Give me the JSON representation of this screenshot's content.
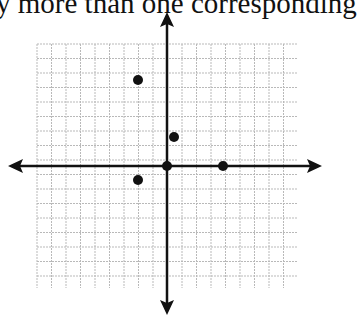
{
  "caption": "y more than one corresponding",
  "graph": {
    "grid": {
      "left": 37,
      "top": 44,
      "right": 297,
      "bottom": 288,
      "cell": 14.5
    },
    "origin": {
      "x": 167,
      "y": 166
    },
    "axes": {
      "x": {
        "start": 8,
        "end": 322
      },
      "y": {
        "start": 12,
        "end": 315
      }
    },
    "points": [
      {
        "label": "(-2, 6)",
        "px": 138,
        "py": 80
      },
      {
        "label": "(0.5, 2)",
        "px": 174,
        "py": 137
      },
      {
        "label": "(0, 0)",
        "px": 167,
        "py": 166
      },
      {
        "label": "(4, 0)",
        "px": 223,
        "py": 166
      },
      {
        "label": "(-2, -1)",
        "px": 138,
        "py": 180
      }
    ],
    "colors": {
      "grid": "#b9b9b9",
      "axis": "#111111",
      "point": "#111111"
    }
  }
}
